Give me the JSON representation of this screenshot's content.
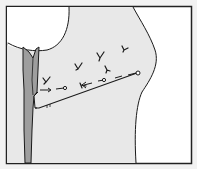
{
  "diagram": {
    "title": "",
    "colors": {
      "background": "#f2f2f2",
      "frame_fill": "#ffffff",
      "frame_stroke": "#222222",
      "body_fill": "#e8e8e8",
      "circle_fill": "#ffffff",
      "strip_fill": "#9e9e9e",
      "line": "#1a1a1a"
    },
    "frame": {
      "x": 6,
      "y": 6,
      "width": 186,
      "height": 158
    },
    "shapes": [
      {
        "id": "round-structure",
        "type": "circle-segment",
        "description": "white rounded structure at top-left"
      },
      {
        "id": "tissue-body",
        "type": "region",
        "description": "light grey body region with curved right edge"
      },
      {
        "id": "vertical-strip",
        "type": "band",
        "description": "dark grey vertical band on left, split at top"
      },
      {
        "id": "solid-line",
        "type": "line",
        "description": "long solid line from left band up to right circle marker"
      },
      {
        "id": "dashed-line",
        "type": "dashed-line",
        "description": "dashed arrow line with circle markers"
      }
    ],
    "markers": [
      {
        "type": "y-mark",
        "x": 46,
        "y": 80
      },
      {
        "type": "y-mark",
        "x": 78,
        "y": 66
      },
      {
        "type": "y-mark",
        "x": 100,
        "y": 55
      },
      {
        "type": "y-mark",
        "x": 124,
        "y": 48
      },
      {
        "type": "y-mark",
        "x": 107,
        "y": 68
      },
      {
        "type": "y-mark",
        "x": 82,
        "y": 85
      },
      {
        "type": "circle",
        "x": 65,
        "y": 88
      },
      {
        "type": "circle",
        "x": 104,
        "y": 80
      },
      {
        "type": "circle",
        "x": 138,
        "y": 73
      }
    ],
    "labels": []
  }
}
